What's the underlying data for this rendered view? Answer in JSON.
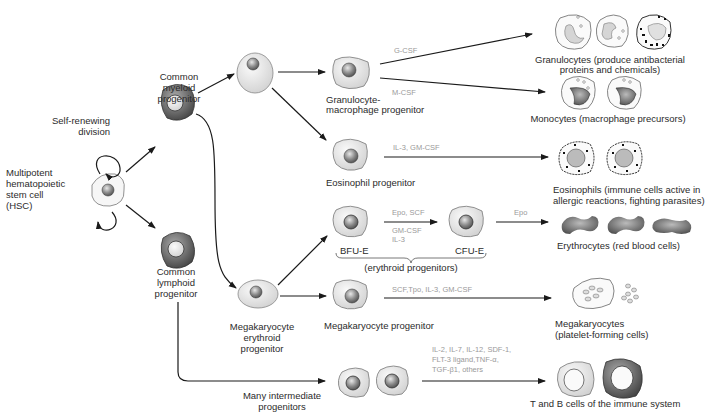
{
  "nodes": {
    "hsc": [
      "Multipotent",
      "hematopoietic",
      "stem cell",
      "(HSC)"
    ],
    "self_renewing": [
      "Self-renewing",
      "division"
    ],
    "cmp": [
      "Common",
      "myeloid",
      "progenitor"
    ],
    "clp": [
      "Common",
      "lymphoid",
      "progenitor"
    ],
    "gmp": [
      "Granulocyte-",
      "macrophage progenitor"
    ],
    "eop": [
      "Eosinophil progenitor"
    ],
    "bfu_e": "BFU-E",
    "cfu_e": "CFU-E",
    "erythroid": "(erythroid progenitors)",
    "mep": [
      "Megakaryocyte",
      "erythroid",
      "progenitor"
    ],
    "mkp": [
      "Megakaryocyte progenitor"
    ],
    "intermediate": [
      "Many intermediate",
      "progenitors"
    ]
  },
  "outputs": {
    "granulocytes": [
      "Granulocytes (produce antibacterial",
      "proteins and chemicals)"
    ],
    "monocytes": [
      "Monocytes (macrophage precursors)"
    ],
    "eosinophils": [
      "Eosinophils (immune cells active in",
      "allergic reactions, fighting parasites)"
    ],
    "erythrocytes": [
      "Erythrocytes (red blood cells)"
    ],
    "megakaryocytes": [
      "Megakaryocytes",
      "(platelet-forming cells)"
    ],
    "tb_cells": [
      "T and B cells of the immune system"
    ]
  },
  "factors": {
    "gcsf": "G-CSF",
    "mcsf": "M-CSF",
    "eo": "IL-3, GM-CSF",
    "epo_scf": "Epo, SCF",
    "gmcsf_il3": [
      "GM-CSF",
      "IL-3"
    ],
    "epo": "Epo",
    "mk": "SCF,Tpo, IL-3, GM-CSF",
    "lymph": [
      "IL-2, IL-7, IL-12, SDF-1,",
      "FLT-3 ligand,TNF-α,",
      "TGF-β1, others"
    ]
  }
}
